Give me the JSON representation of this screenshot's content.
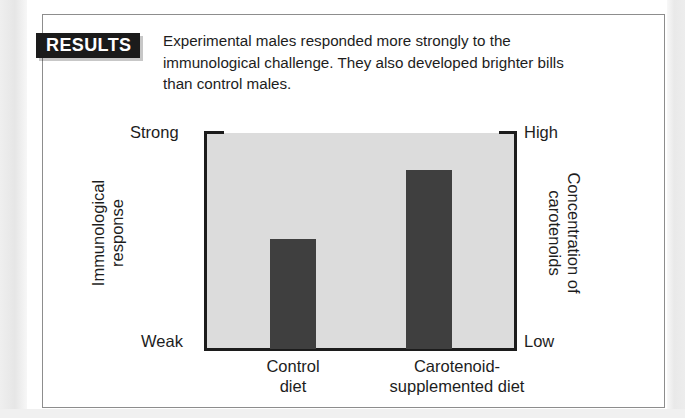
{
  "figure": {
    "tag_label": "RESULTS",
    "caption": "Experimental males responded more strongly to the immunological challenge. They also developed brighter bills than control males."
  },
  "chart_data": {
    "type": "bar",
    "title": "",
    "categories": [
      "Control diet",
      "Carotenoid-supplemented diet"
    ],
    "category_lines": [
      [
        "Control",
        "diet"
      ],
      [
        "Carotenoid-",
        "supplemented diet"
      ]
    ],
    "values": [
      0.51,
      0.83
    ],
    "ylabel": "Immunological response",
    "ylabel_lines": [
      "Immunological",
      "response"
    ],
    "y2label": "Concentration of carotenoids",
    "y2label_lines": [
      "Concentration of",
      "carotenoids"
    ],
    "xlabel": "",
    "ytick_labels": [
      "Weak",
      "Strong"
    ],
    "y2tick_labels": [
      "Low",
      "High"
    ],
    "ylim": [
      0,
      1
    ],
    "grid": false,
    "legend": false,
    "bar_color": "#3f3f3f",
    "plot_background": "#dcdcdc",
    "axis_color": "#1c1c1c"
  },
  "scale": {
    "left_top": "Strong",
    "left_bottom": "Weak",
    "right_top": "High",
    "right_bottom": "Low"
  },
  "colors": {
    "tag_background": "#1b1b1b",
    "tag_text": "#ffffff",
    "frame_border": "#8d8d8d",
    "text": "#1d1d1d"
  }
}
